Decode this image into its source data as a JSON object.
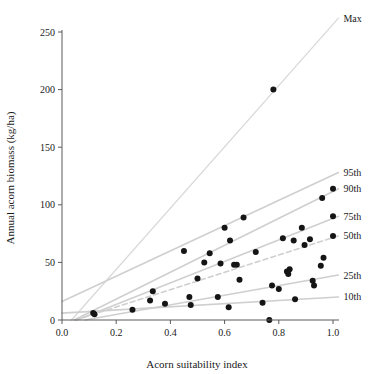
{
  "chart_data": {
    "type": "scatter",
    "title": "",
    "xlabel": "Acorn suitability index",
    "ylabel": "Annual acorn biomass (kg/ha)",
    "xlim": [
      0.0,
      1.05
    ],
    "ylim": [
      0,
      262
    ],
    "grid": false,
    "legend_position": "right-inline-labels",
    "xticks": [
      0.0,
      0.2,
      0.4,
      0.6,
      0.8,
      1.0
    ],
    "xtick_labels": [
      "0.0",
      "0.2",
      "0.4",
      "0.6",
      "0.8",
      "1.0"
    ],
    "yticks": [
      0,
      50,
      100,
      150,
      200,
      250
    ],
    "ytick_labels": [
      "0",
      "50",
      "100",
      "150",
      "200",
      "250"
    ],
    "points": [
      {
        "x": 0.115,
        "y": 6
      },
      {
        "x": 0.12,
        "y": 5
      },
      {
        "x": 0.26,
        "y": 9
      },
      {
        "x": 0.325,
        "y": 17
      },
      {
        "x": 0.335,
        "y": 25
      },
      {
        "x": 0.38,
        "y": 14
      },
      {
        "x": 0.45,
        "y": 60
      },
      {
        "x": 0.47,
        "y": 20
      },
      {
        "x": 0.475,
        "y": 13
      },
      {
        "x": 0.5,
        "y": 36
      },
      {
        "x": 0.525,
        "y": 50
      },
      {
        "x": 0.545,
        "y": 58
      },
      {
        "x": 0.575,
        "y": 20
      },
      {
        "x": 0.585,
        "y": 49
      },
      {
        "x": 0.6,
        "y": 80
      },
      {
        "x": 0.615,
        "y": 11
      },
      {
        "x": 0.62,
        "y": 69
      },
      {
        "x": 0.635,
        "y": 48
      },
      {
        "x": 0.645,
        "y": 48
      },
      {
        "x": 0.655,
        "y": 35
      },
      {
        "x": 0.67,
        "y": 89
      },
      {
        "x": 0.715,
        "y": 59
      },
      {
        "x": 0.74,
        "y": 15
      },
      {
        "x": 0.765,
        "y": 0
      },
      {
        "x": 0.775,
        "y": 30
      },
      {
        "x": 0.78,
        "y": 200
      },
      {
        "x": 0.8,
        "y": 27
      },
      {
        "x": 0.815,
        "y": 71
      },
      {
        "x": 0.83,
        "y": 42
      },
      {
        "x": 0.835,
        "y": 40
      },
      {
        "x": 0.84,
        "y": 44
      },
      {
        "x": 0.855,
        "y": 69
      },
      {
        "x": 0.86,
        "y": 18
      },
      {
        "x": 0.885,
        "y": 80
      },
      {
        "x": 0.895,
        "y": 65
      },
      {
        "x": 0.915,
        "y": 70
      },
      {
        "x": 0.925,
        "y": 34
      },
      {
        "x": 0.93,
        "y": 30
      },
      {
        "x": 0.955,
        "y": 47
      },
      {
        "x": 0.96,
        "y": 106
      },
      {
        "x": 0.965,
        "y": 54
      },
      {
        "x": 1.0,
        "y": 114
      },
      {
        "x": 1.0,
        "y": 90
      },
      {
        "x": 1.0,
        "y": 73
      }
    ],
    "lines": [
      {
        "name": "Max",
        "label": "Max",
        "x0": 0.035,
        "y0": 0,
        "x1": 1.02,
        "y1": 262,
        "style": "solid",
        "weight": "thin"
      },
      {
        "name": "95th",
        "label": "95th",
        "x0": 0.0,
        "y0": 16,
        "x1": 1.02,
        "y1": 128,
        "style": "solid",
        "weight": "normal"
      },
      {
        "name": "90th",
        "label": "90th",
        "x0": 0.045,
        "y0": 0,
        "x1": 1.02,
        "y1": 114,
        "style": "solid",
        "weight": "normal"
      },
      {
        "name": "75th",
        "label": "75th",
        "x0": 0.055,
        "y0": 0,
        "x1": 1.02,
        "y1": 90,
        "style": "solid",
        "weight": "normal"
      },
      {
        "name": "50th",
        "label": "50th",
        "x0": 0.05,
        "y0": 0,
        "x1": 1.02,
        "y1": 73,
        "style": "dashed",
        "weight": "normal"
      },
      {
        "name": "25th",
        "label": "25th",
        "x0": 0.085,
        "y0": 0,
        "x1": 1.02,
        "y1": 39,
        "style": "solid",
        "weight": "normal"
      },
      {
        "name": "10th",
        "label": "10th",
        "x0": 0.0,
        "y0": 6,
        "x1": 1.02,
        "y1": 20,
        "style": "solid",
        "weight": "normal"
      }
    ],
    "series_labels": [
      {
        "key": "max",
        "text": "Max"
      },
      {
        "key": "p95",
        "text": "95th"
      },
      {
        "key": "p90",
        "text": "90th"
      },
      {
        "key": "p75",
        "text": "75th"
      },
      {
        "key": "p50",
        "text": "50th"
      },
      {
        "key": "p25",
        "text": "25th"
      },
      {
        "key": "p10",
        "text": "10th"
      }
    ],
    "colors": {
      "point": "#151515",
      "line": "#cfcfcf",
      "line_faint": "#d8d8d8",
      "axis": "#5a5a5a",
      "text": "#1a1a1a",
      "background": "#ffffff"
    }
  }
}
